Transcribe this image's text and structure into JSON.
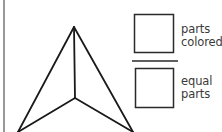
{
  "diagram": {
    "title": "",
    "shape": {
      "type": "triangle-divided-into-3-parts",
      "fill": "none",
      "stroke": "#1a1a1a",
      "vertices": {
        "apex": [
          74,
          27
        ],
        "center": [
          75,
          98
        ],
        "bottom_left": [
          18,
          132
        ],
        "bottom_right": [
          133,
          132
        ]
      }
    },
    "fraction": {
      "numerator_box": {
        "value": ""
      },
      "denominator_box": {
        "value": ""
      },
      "numerator_label": {
        "line1": "parts",
        "line2": "colored"
      },
      "denominator_label": {
        "line1": "equal",
        "line2": "parts"
      }
    },
    "colors": {
      "stroke": "#1a1a1a",
      "box_stroke": "#2a2a2a",
      "label_text": "#3a3a3a",
      "border": "#555555",
      "background": "#ffffff"
    }
  }
}
